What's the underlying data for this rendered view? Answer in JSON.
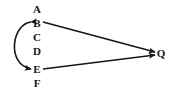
{
  "figure": {
    "background_color": "#ffffff",
    "ink_color": "#151515",
    "width": 169,
    "height": 95
  },
  "nodes": [
    {
      "id": "A",
      "label": "A",
      "x": 37,
      "y": 9
    },
    {
      "id": "B",
      "label": "B",
      "x": 37,
      "y": 23
    },
    {
      "id": "C",
      "label": "C",
      "x": 37,
      "y": 37
    },
    {
      "id": "D",
      "label": "D",
      "x": 37,
      "y": 51
    },
    {
      "id": "E",
      "label": "E",
      "x": 37,
      "y": 69
    },
    {
      "id": "F",
      "label": "F",
      "x": 37,
      "y": 83
    },
    {
      "id": "Q",
      "label": "Q",
      "x": 161,
      "y": 53
    }
  ],
  "edges": [
    {
      "id": "edge-b-to-q",
      "from": "B",
      "to": "Q",
      "style": "straight",
      "arrowheads": "end",
      "path": "M 43 22 L 155 52"
    },
    {
      "id": "edge-e-to-q",
      "from": "E",
      "to": "Q",
      "style": "straight",
      "arrowheads": "end",
      "path": "M 43 69 L 155 55"
    },
    {
      "id": "edge-b-e-curve",
      "from": "B",
      "to": "E",
      "style": "curved-left",
      "arrowheads": "both",
      "path": "M 31 22 C 12 24, 6 64, 31 69"
    }
  ]
}
